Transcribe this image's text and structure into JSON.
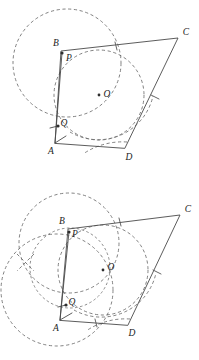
{
  "document": {
    "title": "Geometric construction: quadrilateral ABCD with circle center O and points P, Q",
    "figure_count": 2,
    "background_color": "#ffffff",
    "line_color": "#4a4a4a",
    "dash_color": "#6b6b6b"
  },
  "figures": [
    {
      "id": "figure-top",
      "name": "construction-step-1",
      "labels": {
        "A": "A",
        "B": "B",
        "C": "C",
        "D": "D",
        "O": "O",
        "P": "P",
        "Q": "Q"
      },
      "vertices": {
        "A": [
          55,
          143
        ],
        "B": [
          61,
          51
        ],
        "C": [
          178,
          38
        ],
        "D": [
          125,
          148
        ],
        "O": [
          99,
          95
        ],
        "P": [
          62,
          53
        ],
        "Q": [
          58,
          126
        ]
      },
      "label_positions": {
        "A": [
          51,
          151
        ],
        "B": [
          56,
          44
        ],
        "C": [
          185,
          33
        ],
        "D": [
          128,
          157
        ],
        "O": [
          106,
          95
        ],
        "P": [
          68,
          58
        ],
        "Q": [
          63,
          124
        ]
      },
      "circles": [
        {
          "name": "large-left-circle",
          "center": [
            67,
            63
          ],
          "r": 54,
          "style": "dashed"
        },
        {
          "name": "inscribed-circle",
          "center": [
            99,
            95
          ],
          "r": 45,
          "style": "dashed"
        },
        {
          "name": "right-arc",
          "center": [
            125,
            148
          ],
          "r": 56,
          "style": "dashed-arc",
          "from": 182,
          "to": 300
        },
        {
          "name": "bottom-arc",
          "center": [
            58,
            126
          ],
          "r": 70,
          "style": "dashed-arc",
          "from": 8,
          "to": 70
        }
      ],
      "tick_marks": [
        {
          "name": "tick-bc",
          "at": [
            116,
            46
          ],
          "angle": 78
        },
        {
          "name": "tick-cd",
          "at": [
            155,
            97
          ],
          "angle": 158
        }
      ],
      "marked_points": [
        "O",
        "P",
        "Q"
      ]
    },
    {
      "id": "figure-bottom",
      "name": "construction-step-2",
      "labels": {
        "A": "A",
        "B": "B",
        "C": "C",
        "D": "D",
        "O": "O",
        "P": "P",
        "Q": "Q"
      },
      "vertices": {
        "A": [
          60,
          320
        ],
        "B": [
          68,
          229
        ],
        "C": [
          180,
          215
        ],
        "D": [
          128,
          325
        ],
        "O": [
          103,
          270
        ],
        "P": [
          69,
          232
        ],
        "Q": [
          66,
          305
        ]
      },
      "label_positions": {
        "A": [
          56,
          328
        ],
        "B": [
          62,
          222
        ],
        "C": [
          187,
          211
        ],
        "D": [
          131,
          333
        ],
        "O": [
          110,
          268
        ],
        "P": [
          74,
          234
        ],
        "Q": [
          71,
          303
        ]
      },
      "circles": [
        {
          "name": "upper-left-circle",
          "center": [
            69,
            243
          ],
          "r": 50,
          "style": "dashed"
        },
        {
          "name": "lower-left-circle",
          "center": [
            57,
            290
          ],
          "r": 56,
          "style": "dashed"
        },
        {
          "name": "center-circle",
          "center": [
            103,
            270
          ],
          "r": 45,
          "style": "dashed"
        },
        {
          "name": "mid-lens-circle",
          "center": [
            70,
            268
          ],
          "r": 40,
          "style": "dashed-fine"
        },
        {
          "name": "right-arc",
          "center": [
            128,
            325
          ],
          "r": 56,
          "style": "dashed-arc",
          "from": 182,
          "to": 300
        },
        {
          "name": "bottom-arc",
          "center": [
            66,
            305
          ],
          "r": 70,
          "style": "dashed-arc",
          "from": 8,
          "to": 70
        }
      ],
      "intersection_mark": {
        "name": "x-intersection-mark",
        "at": [
          25,
          262
        ]
      },
      "tick_marks": [
        {
          "name": "tick-bc",
          "at": [
            120,
            222
          ],
          "angle": 78
        },
        {
          "name": "tick-cd",
          "at": [
            157,
            272
          ],
          "angle": 158
        },
        {
          "name": "tick-ad",
          "at": [
            96,
            323
          ],
          "angle": 100
        }
      ],
      "marked_points": [
        "O",
        "P",
        "Q"
      ]
    }
  ]
}
